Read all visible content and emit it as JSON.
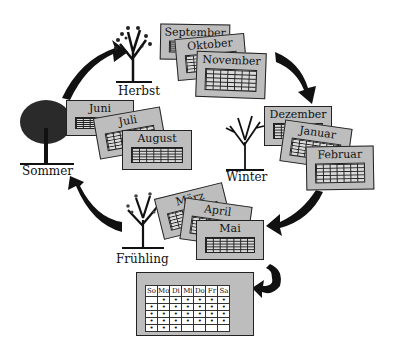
{
  "seasons": [
    {
      "name": "Herbst",
      "months": [
        "September",
        "Oktober",
        "November"
      ]
    },
    {
      "name": "Winter",
      "months": [
        "Dezember",
        "Januar",
        "Februar"
      ]
    },
    {
      "name": "Frühling",
      "months": [
        "März",
        "April",
        "Mai"
      ]
    },
    {
      "name": "Sommer",
      "months": [
        "Juni",
        "Juli",
        "August"
      ]
    }
  ],
  "calendar": {
    "weekdays": [
      "So",
      "Mo",
      "Di",
      "Mi",
      "Do",
      "Fr",
      "Sa"
    ],
    "dot_rows": [
      [
        0,
        1,
        1,
        1,
        1,
        1,
        1
      ],
      [
        1,
        1,
        1,
        1,
        1,
        1,
        1
      ],
      [
        1,
        1,
        1,
        1,
        1,
        1,
        1
      ],
      [
        1,
        1,
        1,
        1,
        1,
        1,
        1
      ],
      [
        1,
        1,
        1,
        0,
        0,
        0,
        0
      ]
    ]
  },
  "colors": {
    "card": "#bdbdbd",
    "grid": "#dadada",
    "ink": "#111111"
  }
}
